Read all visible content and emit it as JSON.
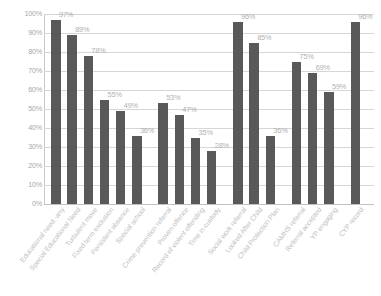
{
  "chart_data": {
    "type": "bar",
    "title": "",
    "subtitle": "",
    "xlabel": "",
    "ylabel": "",
    "ylim": [
      0,
      100
    ],
    "grid": true,
    "legend": false,
    "legend_position": "none",
    "bar_color": "#595959",
    "gridline_color": "#d6d6d6",
    "label_color": "#b0b0b0",
    "y_ticks": [
      "0%",
      "10%",
      "20%",
      "30%",
      "40%",
      "50%",
      "60%",
      "70%",
      "80%",
      "90%",
      "100%"
    ],
    "y_tick_values": [
      0,
      10,
      20,
      30,
      40,
      50,
      60,
      70,
      80,
      90,
      100
    ],
    "categories": [
      "Educational need -any",
      "Special Educational Need",
      "Turbulent move",
      "Fixed term exclusion",
      "Persistent absence",
      "Special school",
      "Crime prevention referral",
      "Proven offence",
      "Record of violent offending",
      "Time in custody",
      "Social work referral",
      "Looked After Child",
      "Child Protection Plan",
      "CAMHS referral",
      "Referral accepted",
      "YP engaging",
      "CYP record"
    ],
    "values": [
      97,
      89,
      78,
      55,
      49,
      36,
      53,
      47,
      35,
      28,
      96,
      85,
      36,
      75,
      69,
      59,
      96
    ],
    "data_labels": [
      "97%",
      "89%",
      "78%",
      "55%",
      "49%",
      "36%",
      "53%",
      "47%",
      "35%",
      "28%",
      "96%",
      "85%",
      "36%",
      "75%",
      "69%",
      "59%",
      "96%"
    ],
    "groups": [
      {
        "name": "Education",
        "start": 0,
        "count": 6
      },
      {
        "name": "Youth justice",
        "start": 6,
        "count": 4
      },
      {
        "name": "Social care",
        "start": 10,
        "count": 3
      },
      {
        "name": "Mental health",
        "start": 13,
        "count": 3
      },
      {
        "name": "CYP record",
        "start": 16,
        "count": 1
      }
    ]
  }
}
